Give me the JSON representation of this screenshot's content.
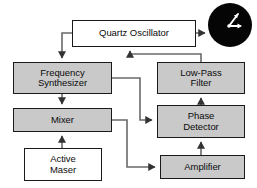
{
  "diagram": {
    "type": "block-diagram",
    "colors": {
      "box_fill_gray": "#c9c9c9",
      "box_fill_white": "#ffffff",
      "box_stroke": "#1a1a1a",
      "line": "#555555",
      "background": "#ffffff",
      "clock_face": "#050505",
      "clock_hands": "#ffffff"
    },
    "nodes": [
      {
        "id": "quartz-oscillator",
        "label_lines": [
          "Quartz Oscillator"
        ],
        "fill": "white",
        "x": 72,
        "y": 20,
        "w": 124,
        "h": 27
      },
      {
        "id": "frequency-synthesizer",
        "label_lines": [
          "Frequency",
          "Synthesizer"
        ],
        "fill": "gray",
        "x": 13,
        "y": 62,
        "w": 99,
        "h": 32
      },
      {
        "id": "low-pass-filter",
        "label_lines": [
          "Low-Pass",
          "Filter"
        ],
        "fill": "gray",
        "x": 157,
        "y": 62,
        "w": 88,
        "h": 32
      },
      {
        "id": "mixer",
        "label_lines": [
          "Mixer"
        ],
        "fill": "gray",
        "x": 13,
        "y": 108,
        "w": 99,
        "h": 24
      },
      {
        "id": "phase-detector",
        "label_lines": [
          "Phase",
          "Detector"
        ],
        "fill": "gray",
        "x": 157,
        "y": 105,
        "w": 88,
        "h": 33
      },
      {
        "id": "active-maser",
        "label_lines": [
          "Active",
          "Maser"
        ],
        "fill": "white",
        "x": 24,
        "y": 148,
        "w": 78,
        "h": 33
      },
      {
        "id": "amplifier",
        "label_lines": [
          "Amplifier"
        ],
        "fill": "gray",
        "x": 160,
        "y": 155,
        "w": 85,
        "h": 24
      }
    ],
    "clock": {
      "id": "clock-output-icon",
      "cx": 230,
      "cy": 25,
      "r": 22,
      "hand_long": {
        "angle_label": "up-right"
      },
      "hand_short": {
        "angle_label": "right"
      }
    },
    "connections": [
      {
        "id": "quartz-to-synthesizer",
        "from": "quartz-oscillator",
        "to": "frequency-synthesizer"
      },
      {
        "id": "quartz-to-clock",
        "from": "quartz-oscillator",
        "to": "clock-output-icon"
      },
      {
        "id": "lowpass-to-quartz",
        "from": "low-pass-filter",
        "to": "quartz-oscillator"
      },
      {
        "id": "synthesizer-to-mixer",
        "from": "frequency-synthesizer",
        "to": "mixer"
      },
      {
        "id": "synthesizer-to-phase-detector",
        "from": "frequency-synthesizer",
        "to": "phase-detector"
      },
      {
        "id": "maser-to-mixer",
        "from": "active-maser",
        "to": "mixer"
      },
      {
        "id": "mixer-to-amplifier",
        "from": "mixer",
        "to": "amplifier"
      },
      {
        "id": "amplifier-to-phase-detector",
        "from": "amplifier",
        "to": "phase-detector"
      },
      {
        "id": "phase-detector-to-lowpass",
        "from": "phase-detector",
        "to": "low-pass-filter"
      }
    ]
  }
}
